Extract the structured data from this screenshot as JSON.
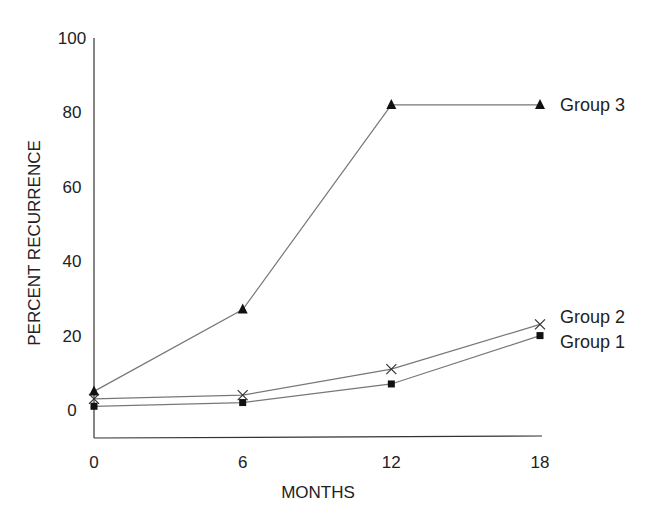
{
  "chart_data": {
    "type": "line",
    "title": "",
    "xlabel": "MONTHS",
    "ylabel": "PERCENT RECURRENCE",
    "x": [
      0,
      6,
      12,
      18
    ],
    "x_tick_labels": [
      "0",
      "6",
      "12",
      "18"
    ],
    "y_tick_labels": [
      "0",
      "20",
      "40",
      "60",
      "80",
      "100"
    ],
    "y_ticks": [
      0,
      20,
      40,
      60,
      80,
      100
    ],
    "xlim": [
      0,
      18
    ],
    "ylim": [
      -8,
      100
    ],
    "grid": false,
    "legend_position": "inline-right",
    "series": [
      {
        "name": "Group 3",
        "marker": "triangle",
        "values": [
          5,
          27,
          82,
          82
        ]
      },
      {
        "name": "Group 2",
        "marker": "x",
        "values": [
          3,
          4,
          11,
          23
        ]
      },
      {
        "name": "Group 1",
        "marker": "square",
        "values": [
          1,
          2,
          7,
          20
        ]
      }
    ]
  },
  "colors": {
    "line": "#777777",
    "marker": "#111111",
    "axis": "#333333",
    "text": "#222222"
  }
}
